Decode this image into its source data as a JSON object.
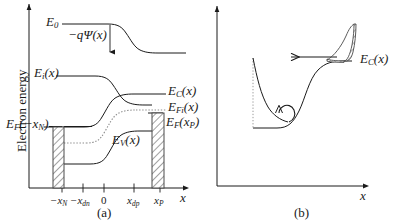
{
  "figure": {
    "axis_label_y": "Electron energy",
    "panel_a_caption": "(a)",
    "panel_b_caption": "(b)",
    "axis_label_x_a": "x",
    "axis_label_x_b": "x"
  },
  "panel_a": {
    "labels": {
      "e0": "E",
      "e0_sub": "0",
      "potential": "−qΨ(x)",
      "ei": "E",
      "ei_sub": "i",
      "ei_arg": "(x)",
      "ec": "E",
      "ec_sub": "C",
      "ec_arg": "(x)",
      "efi": "E",
      "efi_sub": "Fi",
      "efi_arg": "(x)",
      "ef_xp": "E",
      "ef_xp_sub": "F",
      "ef_xp_arg": "(x",
      "ef_xp_sub2": "P",
      "ef_xp_close": ")",
      "ev": "E",
      "ev_sub": "V",
      "ev_arg": "(x)",
      "ef_mxn": "E",
      "ef_mxn_sub": "F",
      "ef_mxn_arg": "(−x",
      "ef_mxn_sub2": "N",
      "ef_mxn_close": ")"
    },
    "x_ticks": [
      {
        "name": "minus-xn",
        "pre": "−x",
        "sub": "N"
      },
      {
        "name": "minus-xdn",
        "pre": "−x",
        "sub": "dn"
      },
      {
        "name": "zero",
        "pre": "0",
        "sub": ""
      },
      {
        "name": "xdp",
        "pre": "x",
        "sub": "dp"
      },
      {
        "name": "xp",
        "pre": "x",
        "sub": "P"
      }
    ]
  },
  "panel_b": {
    "labels": {
      "ec": "E",
      "ec_sub": "C",
      "ec_arg": "(x)"
    }
  },
  "colors": {
    "line": "#1a1a1a",
    "dotted": "#8c8c8c",
    "hatch": "#6e6e6e",
    "background": "#ffffff"
  }
}
